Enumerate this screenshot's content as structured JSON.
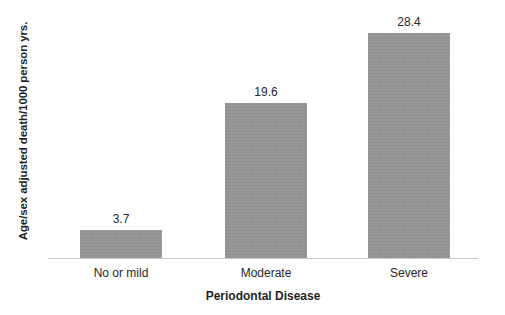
{
  "chart_data": {
    "type": "bar",
    "title": "",
    "subtitle": "",
    "xlabel": "Periodontal Disease",
    "ylabel": "Age/sex adjusted death/1000 person yrs.",
    "categories": [
      "No or mild",
      "Moderate",
      "Severe"
    ],
    "values": [
      3.7,
      19.6,
      28.4
    ],
    "value_labels": [
      "3.7",
      "19.6",
      "28.4"
    ],
    "ylim": [
      0,
      31.5
    ],
    "grid": false,
    "y_axis_ticks_visible": false,
    "y_axis_line_visible": false,
    "x_axis_line_visible": true,
    "legend": null,
    "legend_position": "none",
    "bar_color": "#949494",
    "axis_line_color": "#c9c9c9",
    "text_color": "#262626",
    "background_color": "#ffffff"
  },
  "axes": {
    "y_title": "Age/sex adjusted death/1000 person yrs.",
    "x_title": "Periodontal Disease"
  },
  "bars": [
    {
      "category": "No or mild",
      "value": 3.7,
      "label": "3.7"
    },
    {
      "category": "Moderate",
      "value": 19.6,
      "label": "19.6"
    },
    {
      "category": "Severe",
      "value": 28.4,
      "label": "28.4"
    }
  ]
}
